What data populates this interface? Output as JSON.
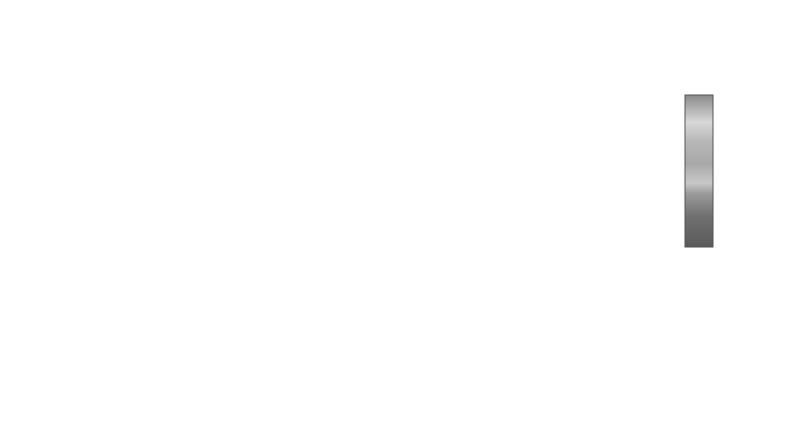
{
  "chart_data": {
    "type": "surface3d",
    "title": "",
    "zlabel": "P",
    "zlabel_sub": "loss",
    "xlabel": "N",
    "ylabel": "M",
    "x_ticks": [
      "0",
      "10",
      "20",
      "30",
      "40",
      "50",
      "60",
      "70",
      "80",
      "90",
      "100"
    ],
    "y_ticks": [
      "100",
      "200",
      "300",
      "400",
      "500",
      "600",
      "700",
      "800",
      "900",
      "1000"
    ],
    "z_ticks": [
      "0",
      "0.1",
      "0.2",
      "0.3",
      "0.4",
      "0.5",
      "0.6",
      "0.7",
      "0.8",
      "0.9",
      "1"
    ],
    "colorbar_ticks": [
      "0",
      "0.1",
      "0.2",
      "0.3",
      "0.4",
      "0.5",
      "0.6",
      "0.7",
      "0.8",
      "0.9",
      "1"
    ],
    "xlim": [
      0,
      100
    ],
    "ylim": [
      100,
      1000
    ],
    "zlim": [
      0,
      1
    ],
    "series": [
      {
        "name": "M=100",
        "knee_N": 2,
        "values": "drops to ~0 by N~5"
      },
      {
        "name": "M=200",
        "knee_N": 5
      },
      {
        "name": "M=300",
        "knee_N": 8
      },
      {
        "name": "M=400",
        "knee_N": 11
      },
      {
        "name": "M=500",
        "knee_N": 14
      },
      {
        "name": "M=600",
        "knee_N": 17
      },
      {
        "name": "M=700",
        "knee_N": 20
      },
      {
        "name": "M=800",
        "knee_N": 23
      },
      {
        "name": "M=900",
        "knee_N": 26
      },
      {
        "name": "M=1000",
        "knee_N": 29
      }
    ]
  },
  "labels": {
    "z_main": "P",
    "z_sub": "loss",
    "x_title": "N",
    "y_title": "M"
  }
}
